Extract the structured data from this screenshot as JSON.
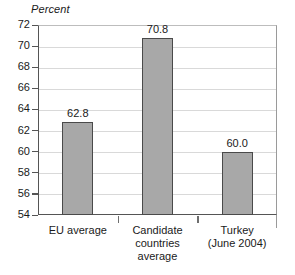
{
  "chart_data": {
    "type": "bar",
    "title": "",
    "subtitle": "",
    "xlabel": "",
    "ylabel": "Percent",
    "ylim": [
      54,
      72
    ],
    "ytick_step": 2,
    "yticks": [
      72,
      70,
      68,
      66,
      64,
      62,
      60,
      58,
      56,
      54
    ],
    "grid": true,
    "legend": "none",
    "categories": [
      "EU average",
      "Candidate\ncountries\naverage",
      "Turkey\n(June 2004)"
    ],
    "values": [
      62.8,
      70.8,
      60.0
    ],
    "value_labels": [
      "62.8",
      "70.8",
      "60.0"
    ],
    "colors": {
      "bar_fill": "#a8a8a8",
      "bar_border": "#4a4a4a",
      "gridline": "#d9d9d9",
      "axis": "#555555",
      "text": "#1a1a1a",
      "background": "#ffffff"
    }
  }
}
